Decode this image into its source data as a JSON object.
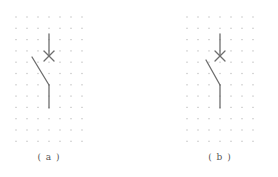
{
  "figures": [
    {
      "id": "a",
      "label": "( a )",
      "grid": {
        "x0": 16,
        "y0": 17,
        "cols": 7,
        "rows": 12,
        "dx": 11,
        "dy": 11.3
      },
      "switch": {
        "top": [
          49,
          34
        ],
        "cross": [
          49,
          56
        ],
        "blade_start": [
          32,
          57
        ],
        "pivot": [
          49,
          85
        ],
        "bottom": [
          49,
          108
        ]
      },
      "label_pos": [
        49,
        152
      ]
    },
    {
      "id": "b",
      "label": "( b )",
      "grid": {
        "x0": 187,
        "y0": 17,
        "cols": 7,
        "rows": 12,
        "dx": 11,
        "dy": 11.3
      },
      "switch": {
        "top": [
          220,
          34
        ],
        "cross": [
          220,
          56
        ],
        "blade_start": [
          206,
          60
        ],
        "pivot": [
          220,
          85
        ],
        "bottom": [
          220,
          108
        ]
      },
      "label_pos": [
        220,
        152
      ]
    }
  ],
  "colors": {
    "line": "#6e6e6e",
    "dot": "#bdbdbd",
    "text": "#555555"
  }
}
